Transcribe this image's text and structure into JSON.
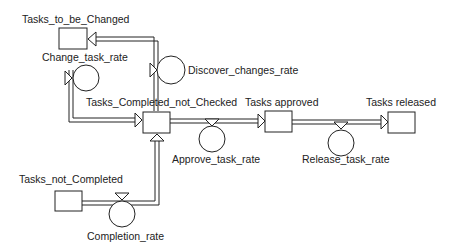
{
  "diagram": {
    "type": "stock-and-flow",
    "stocks": [
      {
        "id": "tasks_to_be_changed",
        "label": "Tasks_to_be_Changed"
      },
      {
        "id": "tasks_completed_not_checked",
        "label": "Tasks_Completed_not_Checked"
      },
      {
        "id": "tasks_approved",
        "label": "Tasks approved"
      },
      {
        "id": "tasks_released",
        "label": "Tasks released"
      },
      {
        "id": "tasks_not_completed",
        "label": "Tasks_not_Completed"
      }
    ],
    "flows": [
      {
        "id": "change_task_rate",
        "label": "Change_task_rate",
        "from": "tasks_to_be_changed",
        "to": "tasks_completed_not_checked"
      },
      {
        "id": "discover_changes_rate",
        "label": "Discover_changes_rate",
        "from": "tasks_completed_not_checked",
        "to": "tasks_to_be_changed"
      },
      {
        "id": "approve_task_rate",
        "label": "Approve_task_rate",
        "from": "tasks_completed_not_checked",
        "to": "tasks_approved"
      },
      {
        "id": "release_task_rate",
        "label": "Release_task_rate",
        "from": "tasks_approved",
        "to": "tasks_released"
      },
      {
        "id": "completion_rate",
        "label": "Completion_rate",
        "from": "tasks_not_completed",
        "to": "tasks_completed_not_checked"
      }
    ],
    "colors": {
      "line": "#222222",
      "background": "#ffffff"
    }
  }
}
